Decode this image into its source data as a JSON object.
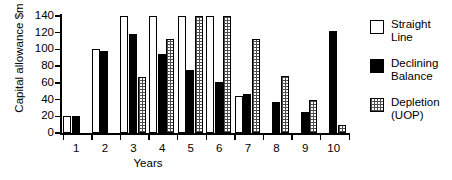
{
  "chart_data": {
    "type": "bar",
    "title": "",
    "xlabel": "Years",
    "ylabel": "Capital allowance $m",
    "categories": [
      "1",
      "2",
      "3",
      "4",
      "5",
      "6",
      "7",
      "8",
      "9",
      "10"
    ],
    "ylim": [
      0,
      140
    ],
    "yticks": [
      0,
      20,
      40,
      60,
      80,
      100,
      120,
      140
    ],
    "grid": false,
    "legend_position": "right",
    "series": [
      {
        "name": "Straight Line",
        "legend_label": "Straight\nLine",
        "swatch": "white-open-square",
        "values": [
          20,
          100,
          140,
          140,
          140,
          140,
          44,
          0,
          0,
          0
        ]
      },
      {
        "name": "Declining Balance",
        "legend_label": "Declining\nBalance",
        "swatch": "black-filled-square",
        "values": [
          20,
          98,
          118,
          94,
          76,
          61,
          47,
          37,
          25,
          122
        ]
      },
      {
        "name": "Depletion (UOP)",
        "legend_label": "Depletion\n(UOP)",
        "swatch": "dotted-square",
        "values": [
          0,
          0,
          67,
          113,
          140,
          140,
          113,
          68,
          40,
          10
        ]
      }
    ]
  },
  "axes": {
    "y_title": "Capital allowance $m",
    "x_title": "Years",
    "y_tick_labels": [
      "140",
      "120",
      "100",
      "80",
      "60",
      "40",
      "20",
      "0"
    ],
    "x_tick_labels": [
      "1",
      "2",
      "3",
      "4",
      "5",
      "6",
      "7",
      "8",
      "9",
      "10"
    ]
  },
  "legend": {
    "items": [
      {
        "label": "Straight\nLine",
        "color": "#ffffff"
      },
      {
        "label": "Declining\nBalance",
        "color": "#000000"
      },
      {
        "label": "Depletion\n(UOP)",
        "color": "#bdbdbd"
      }
    ]
  },
  "colors": {
    "straight_line": "#ffffff",
    "declining_balance": "#000000",
    "depletion": "#bdbdbd",
    "axis": "#000000",
    "background": "#ffffff"
  }
}
